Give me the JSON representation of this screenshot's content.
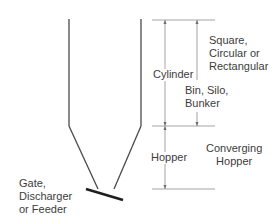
{
  "diagram": {
    "labels": {
      "shape": [
        "Square,",
        "Circular or",
        "Rectangular"
      ],
      "cylinder": "Cylinder",
      "bin": [
        "Bin, Silo,",
        "Bunker"
      ],
      "hopper": "Hopper",
      "converging_hopper": [
        "Converging",
        "Hopper"
      ],
      "gate": [
        "Gate,",
        "Discharger",
        "or Feeder"
      ]
    },
    "colors": {
      "wall": "#3a3a3a",
      "dimension": "#8a8a8a",
      "feeder": "#1e1e1e",
      "text": "#3c3c3c"
    }
  }
}
